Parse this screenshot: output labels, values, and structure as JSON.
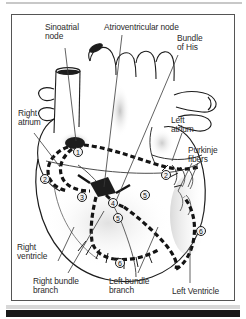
{
  "figure": {
    "labels": [
      {
        "id": "sinoatrial-node",
        "text": "Sinoatrial\nnode",
        "x": 33,
        "y": 8
      },
      {
        "id": "atrioventricular-node",
        "text": "Atrioventricular node",
        "x": 92,
        "y": 8
      },
      {
        "id": "bundle-of-his",
        "text": "Bundle\nof His",
        "x": 165,
        "y": 19
      },
      {
        "id": "right-atrium",
        "text": "Right\natrium",
        "x": 6,
        "y": 94
      },
      {
        "id": "left-atrium",
        "text": "Left\natrium",
        "x": 159,
        "y": 101
      },
      {
        "id": "purkinje-fibers",
        "text": "Purkinje\nfibers",
        "x": 176,
        "y": 131
      },
      {
        "id": "right-ventricle",
        "text": "Right\nventricle",
        "x": 5,
        "y": 228
      },
      {
        "id": "right-bundle-branch",
        "text": "Right bundle\nbranch",
        "x": 21,
        "y": 262
      },
      {
        "id": "left-bundle-branch",
        "text": "Left bundle\nbranch",
        "x": 97,
        "y": 262
      },
      {
        "id": "left-ventricle",
        "text": "Left Ventricle",
        "x": 160,
        "y": 272
      }
    ],
    "markers": [
      {
        "id": "marker-1",
        "label": "1",
        "x": 61,
        "y": 132
      },
      {
        "id": "marker-2-right",
        "label": "2",
        "x": 28,
        "y": 159
      },
      {
        "id": "marker-2-left",
        "label": "2",
        "x": 149,
        "y": 155
      },
      {
        "id": "marker-3",
        "label": "3",
        "x": 65,
        "y": 177
      },
      {
        "id": "marker-4",
        "label": "4",
        "x": 96,
        "y": 183
      },
      {
        "id": "marker-5-upper",
        "label": "5",
        "x": 128,
        "y": 175
      },
      {
        "id": "marker-5-lower",
        "label": "5",
        "x": 101,
        "y": 198
      },
      {
        "id": "marker-6-right",
        "label": "6",
        "x": 184,
        "y": 211
      },
      {
        "id": "marker-6-bottom",
        "label": "6",
        "x": 103,
        "y": 243
      }
    ],
    "colors": {
      "outline": "#1d1d1d",
      "conduction_path": "#141414",
      "frame": "#555555",
      "background": "#ffffff",
      "tissue_shade": "#b9b9b9",
      "bottom_bar": "#1a1a1a"
    }
  }
}
